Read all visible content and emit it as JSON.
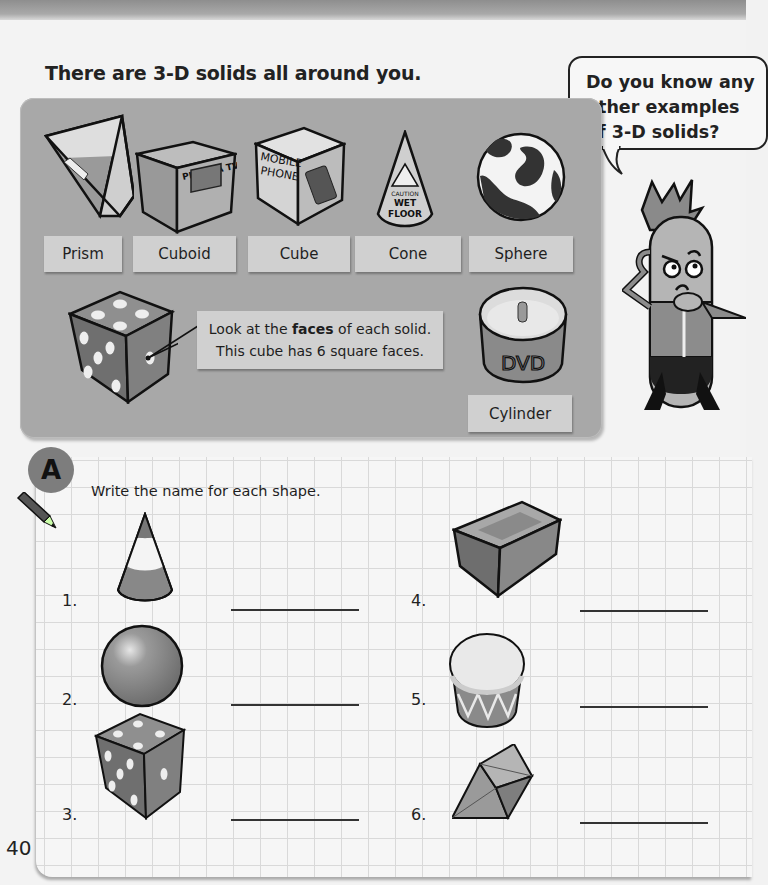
{
  "page": {
    "intro": "There are 3-D solids all around you.",
    "page_number": "40"
  },
  "bubble": {
    "lines": [
      "Do you know any",
      "other examples",
      "of 3-D solids?"
    ]
  },
  "examples": {
    "labels": [
      {
        "name": "prism",
        "text": "Prism"
      },
      {
        "name": "cuboid",
        "text": "Cuboid"
      },
      {
        "name": "cube",
        "text": "Cube"
      },
      {
        "name": "cone",
        "text": "Cone"
      },
      {
        "name": "sphere",
        "text": "Sphere"
      },
      {
        "name": "cylinder",
        "text": "Cylinder"
      }
    ],
    "object_text": {
      "cuboid": "PLASMA TV",
      "cube_line1": "MOBILE",
      "cube_line2": "PHONE",
      "cone_line1": "CAUTION",
      "cone_line2": "WET",
      "cone_line3": "FLOOR",
      "cylinder": "DVD"
    },
    "callout": {
      "pre": "Look at the ",
      "bold": "faces",
      "post": " of each solid.",
      "line2": "This cube has 6 square faces."
    }
  },
  "exercise": {
    "badge": "A",
    "instruction": "Write the name for each shape.",
    "questions": [
      {
        "number": "1.",
        "shape_icon": "cone-icon",
        "answer": ""
      },
      {
        "number": "2.",
        "shape_icon": "sphere-icon",
        "answer": ""
      },
      {
        "number": "3.",
        "shape_icon": "cube-icon",
        "answer": ""
      },
      {
        "number": "4.",
        "shape_icon": "cuboid-icon",
        "answer": ""
      },
      {
        "number": "5.",
        "shape_icon": "cylinder-icon",
        "answer": ""
      },
      {
        "number": "6.",
        "shape_icon": "prism-icon",
        "answer": ""
      }
    ]
  },
  "colors": {
    "panel": "#a8a8a8",
    "label": "#d0d0d0",
    "badge": "#7d7d7d",
    "grid": "#d9d9d9"
  }
}
